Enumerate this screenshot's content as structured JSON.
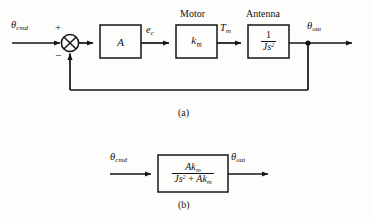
{
  "figure": {
    "background_color": "#fdfdfb",
    "line_color": "#141414",
    "captions": {
      "a": "(a)",
      "b": "(b)"
    }
  },
  "diagram_a": {
    "input_signal": {
      "base": "θ",
      "sub": "cmd"
    },
    "summing_junction": {
      "name": "summing-junction",
      "plus_sign": "+",
      "minus_sign": "−",
      "symbol": "circle-with-x"
    },
    "blocks": [
      {
        "id": "amplifier",
        "above_label": "",
        "content": "A",
        "kind": "plain"
      },
      {
        "id": "motor",
        "above_label": "Motor",
        "content_base": "k",
        "content_sub": "m",
        "kind": "subscripted"
      },
      {
        "id": "antenna",
        "above_label": "Antenna",
        "numerator": "1",
        "den_base": "Js",
        "den_sup": "2",
        "kind": "fraction"
      }
    ],
    "signals": [
      {
        "id": "error-signal",
        "base": "e",
        "sub": "c"
      },
      {
        "id": "torque-signal",
        "base": "T",
        "sub": "m"
      },
      {
        "id": "output-signal",
        "base": "θ",
        "sub": "out"
      }
    ],
    "feedback_path": {
      "name": "feedback-loop",
      "description": "unity feedback from output to summing junction"
    }
  },
  "diagram_b": {
    "input_signal": {
      "base": "θ",
      "sub": "cmd"
    },
    "output_signal": {
      "base": "θ",
      "sub": "out"
    },
    "transfer_function": {
      "numerator_base": "Ak",
      "numerator_sub": "m",
      "denominator_term1_base": "Js",
      "denominator_term1_sup": "2",
      "denominator_operator": "+",
      "denominator_term2_base": "Ak",
      "denominator_term2_sub": "m"
    }
  }
}
